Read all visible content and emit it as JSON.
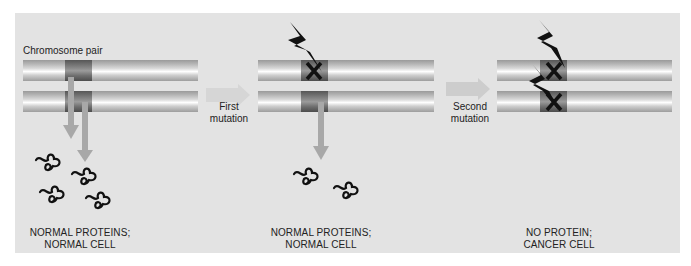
{
  "diagram": {
    "title_label": "Chromosome pair",
    "transitions": [
      {
        "line1": "First",
        "line2": "mutation"
      },
      {
        "line1": "Second",
        "line2": "mutation"
      }
    ],
    "stages": [
      {
        "caption_line1": "NORMAL PROTEINS;",
        "caption_line2": "NORMAL CELL",
        "mutations": 0,
        "protein_count": 4
      },
      {
        "caption_line1": "NORMAL PROTEINS;",
        "caption_line2": "NORMAL CELL",
        "mutations": 1,
        "protein_count": 2
      },
      {
        "caption_line1": "NO PROTEIN;",
        "caption_line2": "CANCER CELL",
        "mutations": 2,
        "protein_count": 0
      }
    ],
    "colors": {
      "panel_bg": "#e3e3e3",
      "chromosome": "#c8c8c8",
      "gene_region": "#555555",
      "arrow": "#a8a8a8",
      "mark": "#111111"
    },
    "icons": {
      "mutation": "lightning-bolt-icon",
      "knockout": "x-mark-icon",
      "protein": "folded-protein-icon",
      "transcription": "down-arrow-icon",
      "transition": "right-block-arrow-icon"
    }
  }
}
